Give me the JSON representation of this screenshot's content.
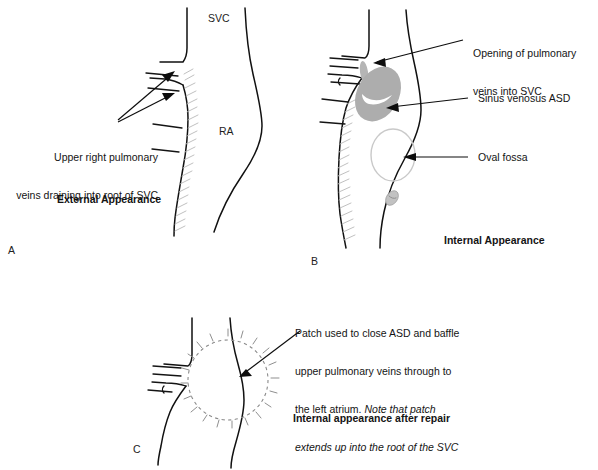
{
  "figure": {
    "background_color": "#ffffff",
    "ink_color": "#111111",
    "asd_fill_color": "#adadad",
    "hatch_color": "#b9b9b9",
    "patch_stitch_color": "#8f8f8f"
  },
  "panels": [
    {
      "letter": "A",
      "caption": "External Appearance",
      "anatomy_labels": [
        {
          "name": "svc",
          "text": "SVC"
        },
        {
          "name": "ra",
          "text": "RA"
        }
      ],
      "annotations": [
        {
          "name": "upper-right-pulmonary-veins",
          "lines": [
            "Upper right pulmonary",
            "veins draining into root of SVC"
          ],
          "arrow_count": 2
        }
      ]
    },
    {
      "letter": "B",
      "caption": "Internal Appearance",
      "anatomy_labels": [],
      "annotations": [
        {
          "name": "opening-of-pulmonary-veins",
          "lines": [
            "Opening of pulmonary",
            "veins into SVC"
          ],
          "arrow_count": 1
        },
        {
          "name": "sinus-venosus-asd",
          "lines": [
            "Sinus venosus ASD"
          ],
          "arrow_count": 1
        },
        {
          "name": "oval-fossa",
          "lines": [
            "Oval fossa"
          ],
          "arrow_count": 1
        }
      ]
    },
    {
      "letter": "C",
      "caption": "Internal appearance after repair",
      "anatomy_labels": [],
      "annotations": [
        {
          "name": "patch-description",
          "lines_plain": [
            "Patch used to close ASD and baffle",
            "upper pulmonary veins through to",
            "the left atrium. "
          ],
          "lines_italic": [
            "Note that patch",
            "extends up into the root of the SVC"
          ],
          "arrow_count": 1
        }
      ]
    }
  ],
  "text": {
    "panel_a": {
      "letter": "A",
      "svc_label": "SVC",
      "ra_label": "RA",
      "vein_annotation_line1": "Upper right pulmonary",
      "vein_annotation_line2": "veins draining into root of SVC",
      "caption": "External Appearance"
    },
    "panel_b": {
      "letter": "B",
      "opening_line1": "Opening of pulmonary",
      "opening_line2": "veins into SVC",
      "asd_label": "Sinus venosus ASD",
      "fossa_label": "Oval fossa",
      "caption": "Internal Appearance"
    },
    "panel_c": {
      "letter": "C",
      "patch_line1": "Patch used to close ASD and baffle",
      "patch_line2": "upper pulmonary veins through to",
      "patch_line3_plain": "the left atrium. ",
      "patch_line3_italic": "Note that patch",
      "patch_line4_italic": "extends up into the root of the SVC",
      "caption": "Internal appearance after repair"
    }
  }
}
